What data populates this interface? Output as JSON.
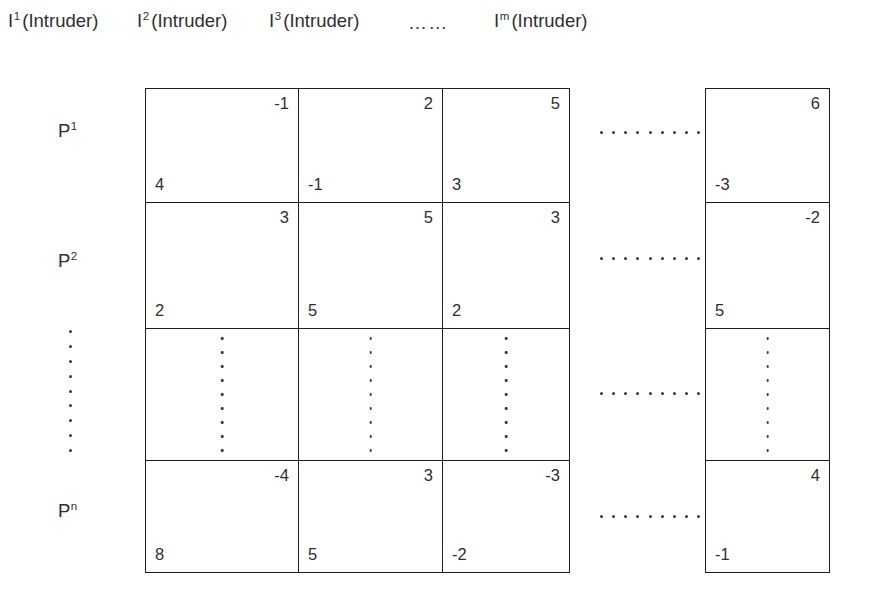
{
  "figure": {
    "column_headers": [
      {
        "symbol": "I",
        "superscript": "1",
        "name": "(Intruder)",
        "left_px": 8
      },
      {
        "symbol": "I",
        "superscript": "2",
        "name": "(Intruder)",
        "left_px": 137
      },
      {
        "symbol": "I",
        "superscript": "3",
        "name": "(Intruder)",
        "left_px": 269
      },
      {
        "symbol": "I",
        "superscript": "m",
        "name": "(Intruder)",
        "left_px": 494
      }
    ],
    "column_header_ellipsis": "……",
    "column_header_ellipsis_left_px": 408,
    "row_headers": [
      {
        "symbol": "P",
        "superscript": "1",
        "top_px": 120,
        "left_px": 58
      },
      {
        "symbol": "P",
        "superscript": "2",
        "top_px": 250,
        "left_px": 58
      },
      {
        "symbol": "P",
        "superscript": "n",
        "top_px": 500,
        "left_px": 58
      }
    ],
    "row_header_vertical_dots_count": 9,
    "matrix": {
      "rows": [
        {
          "label": "P1",
          "type": "values",
          "cells": [
            {
              "top_right": "-1",
              "bottom_left": "4"
            },
            {
              "top_right": "2",
              "bottom_left": "-1"
            },
            {
              "top_right": "5",
              "bottom_left": "3"
            }
          ],
          "last_cell": {
            "top_right": "6",
            "bottom_left": "-3"
          },
          "ellipsis_top_px": 131
        },
        {
          "label": "P2",
          "type": "values",
          "cells": [
            {
              "top_right": "3",
              "bottom_left": "2"
            },
            {
              "top_right": "5",
              "bottom_left": "5"
            },
            {
              "top_right": "3",
              "bottom_left": "2"
            }
          ],
          "last_cell": {
            "top_right": "-2",
            "bottom_left": "5"
          },
          "ellipsis_top_px": 257
        },
        {
          "label": "dots",
          "type": "continuation",
          "cells": [
            {},
            {},
            {}
          ],
          "last_cell": {},
          "cell_vertical_dots_count": 9,
          "ellipsis_top_px": 392
        },
        {
          "label": "Pn",
          "type": "values",
          "cells": [
            {
              "top_right": "-4",
              "bottom_left": "8"
            },
            {
              "top_right": "3",
              "bottom_left": "5"
            },
            {
              "top_right": "-3",
              "bottom_left": "-2"
            }
          ],
          "last_cell": {
            "top_right": "4",
            "bottom_left": "-1"
          },
          "ellipsis_top_px": 515
        }
      ]
    },
    "horizontal_ellipsis_dot_count": 9,
    "colors": {
      "background": "#ffffff",
      "border": "#1d1d1d",
      "text": "#2e2e2e",
      "dot": "#3a3a3a"
    }
  }
}
